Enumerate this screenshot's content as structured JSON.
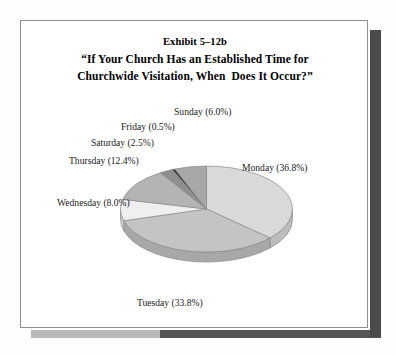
{
  "document": {
    "frame_border_color": "#8e8e92",
    "background_color": "#ffffff",
    "shadow_color": "#4b4b4d"
  },
  "title": {
    "exhibit": "Exhibit 5–12b",
    "question_line1": "“If Your Church Has an Established Time for",
    "question_line2": "Churchwide Visitation, When  Does It Occur?”"
  },
  "labels": {
    "sunday": "Sunday (6.0%)",
    "monday": "Monday (36.8%)",
    "tuesday": "Tuesday (33.8%)",
    "wednesday": "Wednesday (8.0%)",
    "thursday": "Thursday (12.4%)",
    "friday": "Friday (0.5%)",
    "saturday": "Saturday (2.5%)"
  },
  "chart_data": {
    "type": "pie",
    "xlabel": "",
    "ylabel": "",
    "three_d": true,
    "start_angle_deg": 0,
    "direction": "clockwise",
    "legend": "none (slices labeled directly with leader-free callouts)",
    "grid": false,
    "categories": [
      "Monday",
      "Tuesday",
      "Wednesday",
      "Thursday",
      "Saturday",
      "Friday",
      "Sunday"
    ],
    "values": [
      36.8,
      33.8,
      8.0,
      12.4,
      2.5,
      0.5,
      6.0
    ],
    "unit": "%",
    "total": 100.0,
    "slices": [
      {
        "name": "Monday",
        "value": 36.8,
        "label": "Monday (36.8%)",
        "color": "#d9d9d9",
        "side_color": "#bdbdbd"
      },
      {
        "name": "Tuesday",
        "value": 33.8,
        "label": "Tuesday (33.8%)",
        "color": "#c4c4c4",
        "side_color": "#a8a8a8"
      },
      {
        "name": "Wednesday",
        "value": 8.0,
        "label": "Wednesday (8.0%)",
        "color": "#efefef",
        "side_color": "#d2d2d2"
      },
      {
        "name": "Thursday",
        "value": 12.4,
        "label": "Thursday (12.4%)",
        "color": "#b4b4b4",
        "side_color": "#9a9a9a"
      },
      {
        "name": "Saturday",
        "value": 2.5,
        "label": "Saturday (2.5%)",
        "color": "#8f8f8f",
        "side_color": "#7a7a7a"
      },
      {
        "name": "Friday",
        "value": 0.5,
        "label": "Friday (0.5%)",
        "color": "#2b2b2b",
        "side_color": "#1f1f1f"
      },
      {
        "name": "Sunday",
        "value": 6.0,
        "label": "Sunday (6.0%)",
        "color": "#a8a8a8",
        "side_color": "#8e8e8e"
      }
    ]
  }
}
